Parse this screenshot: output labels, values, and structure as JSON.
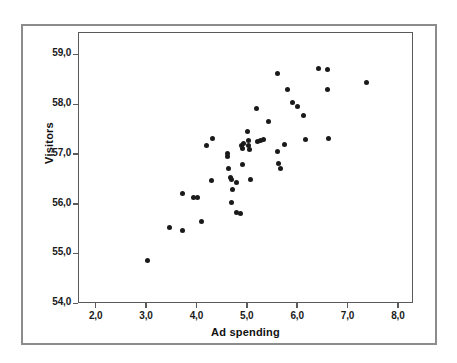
{
  "figure": {
    "caption_fragment": ""
  },
  "chart_data": {
    "type": "scatter",
    "title": "",
    "xlabel": "Ad spending",
    "ylabel": "Visitors",
    "xlim": [
      1.65,
      8.3
    ],
    "ylim": [
      54.0,
      59.45
    ],
    "grid": false,
    "legend": null,
    "xticks": [
      2.0,
      3.0,
      4.0,
      5.0,
      6.0,
      7.0,
      8.0
    ],
    "xtick_labels": [
      "2,0",
      "3,0",
      "4,0",
      "5,0",
      "6,0",
      "7,0",
      "8,0"
    ],
    "yticks": [
      54.0,
      55.0,
      56.0,
      57.0,
      58.0,
      59.0
    ],
    "ytick_labels": [
      "54,0",
      "55,0",
      "56,0",
      "57,0",
      "58,0",
      "59,0"
    ],
    "decimal_separator": ",",
    "marker": {
      "shape": "circle",
      "color": "#1a1a1a",
      "size": 5
    },
    "n_points": 48,
    "points": [
      {
        "x": 3.0,
        "y": 54.87
      },
      {
        "x": 3.45,
        "y": 55.53
      },
      {
        "x": 3.7,
        "y": 55.48
      },
      {
        "x": 3.7,
        "y": 56.22
      },
      {
        "x": 3.93,
        "y": 56.15
      },
      {
        "x": 4.0,
        "y": 56.15
      },
      {
        "x": 4.08,
        "y": 55.66
      },
      {
        "x": 4.18,
        "y": 57.18
      },
      {
        "x": 4.3,
        "y": 57.33
      },
      {
        "x": 4.28,
        "y": 56.48
      },
      {
        "x": 4.6,
        "y": 57.03
      },
      {
        "x": 4.6,
        "y": 56.96
      },
      {
        "x": 4.62,
        "y": 56.72
      },
      {
        "x": 4.65,
        "y": 56.55
      },
      {
        "x": 4.68,
        "y": 56.5
      },
      {
        "x": 4.7,
        "y": 56.3
      },
      {
        "x": 4.68,
        "y": 56.05
      },
      {
        "x": 4.78,
        "y": 55.85
      },
      {
        "x": 4.85,
        "y": 55.82
      },
      {
        "x": 4.78,
        "y": 56.45
      },
      {
        "x": 4.88,
        "y": 57.18
      },
      {
        "x": 4.9,
        "y": 57.12
      },
      {
        "x": 4.9,
        "y": 56.8
      },
      {
        "x": 4.92,
        "y": 57.22
      },
      {
        "x": 5.0,
        "y": 57.47
      },
      {
        "x": 5.02,
        "y": 57.28
      },
      {
        "x": 5.02,
        "y": 57.18
      },
      {
        "x": 5.04,
        "y": 57.1
      },
      {
        "x": 5.05,
        "y": 56.5
      },
      {
        "x": 5.2,
        "y": 57.27
      },
      {
        "x": 5.26,
        "y": 57.29
      },
      {
        "x": 5.32,
        "y": 57.3
      },
      {
        "x": 5.18,
        "y": 57.93
      },
      {
        "x": 5.42,
        "y": 57.68
      },
      {
        "x": 5.6,
        "y": 58.64
      },
      {
        "x": 5.6,
        "y": 57.07
      },
      {
        "x": 5.62,
        "y": 56.83
      },
      {
        "x": 5.64,
        "y": 56.72
      },
      {
        "x": 5.72,
        "y": 57.21
      },
      {
        "x": 5.78,
        "y": 58.32
      },
      {
        "x": 5.88,
        "y": 58.06
      },
      {
        "x": 5.98,
        "y": 57.97
      },
      {
        "x": 6.1,
        "y": 57.8
      },
      {
        "x": 6.15,
        "y": 57.3
      },
      {
        "x": 6.4,
        "y": 58.74
      },
      {
        "x": 6.58,
        "y": 58.72
      },
      {
        "x": 6.58,
        "y": 58.32
      },
      {
        "x": 6.6,
        "y": 57.32
      },
      {
        "x": 7.35,
        "y": 58.45
      }
    ]
  }
}
